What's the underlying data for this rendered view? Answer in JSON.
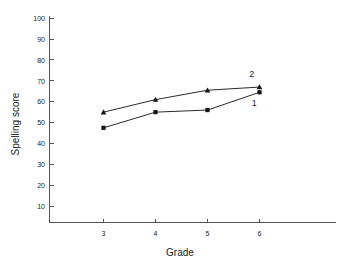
{
  "chart_data": {
    "type": "line",
    "title": "",
    "xlabel": "Grade",
    "ylabel": "Spelling score",
    "x": [
      3,
      4,
      5,
      6
    ],
    "categories": [
      "3",
      "4",
      "5",
      "6"
    ],
    "xlim": [
      2.5,
      6.75
    ],
    "ylim": [
      0,
      100
    ],
    "yticks": [
      10,
      20,
      30,
      40,
      50,
      60,
      70,
      80,
      90,
      100
    ],
    "ytick_labels": [
      "10",
      "20",
      "30",
      "40",
      "50",
      "60",
      "70",
      "80",
      "90",
      "100"
    ],
    "xticks": [
      3,
      4,
      5,
      6
    ],
    "xtick_labels": [
      "3",
      "4",
      "5",
      "6"
    ],
    "grid": false,
    "legend_position": "inline-end-of-line",
    "series": [
      {
        "name": "2",
        "label": "2",
        "marker": "triangle",
        "color": "#141414",
        "values": [
          55,
          61,
          65.5,
          67
        ]
      },
      {
        "name": "1",
        "label": "1",
        "marker": "square",
        "color": "#141414",
        "values": [
          47.5,
          55,
          56,
          64.5
        ]
      }
    ],
    "annotations": [
      {
        "text": "2",
        "x": 5.85,
        "y": 72
      },
      {
        "text": "1",
        "x": 5.9,
        "y": 58
      }
    ]
  },
  "axes": {
    "y_title": "Spelling score",
    "x_title": "Grade"
  }
}
